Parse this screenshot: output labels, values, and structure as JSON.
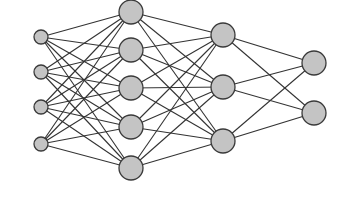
{
  "diagram": {
    "type": "neural-network",
    "colors": {
      "node_fill": "#c4c4c4",
      "node_stroke": "#3a3a3a",
      "edge": "#333333",
      "background": "#ffffff"
    },
    "layers": [
      {
        "name": "input",
        "x": 41,
        "r": 7,
        "nodes": [
          37,
          72,
          107,
          144
        ]
      },
      {
        "name": "hidden-1",
        "x": 131,
        "r": 12,
        "nodes": [
          12,
          50,
          88,
          127,
          168
        ]
      },
      {
        "name": "hidden-2",
        "x": 223,
        "r": 12,
        "nodes": [
          35,
          87,
          141
        ]
      },
      {
        "name": "output",
        "x": 314,
        "r": 12,
        "nodes": [
          63,
          113
        ]
      }
    ],
    "connectivity": "fully-connected"
  }
}
